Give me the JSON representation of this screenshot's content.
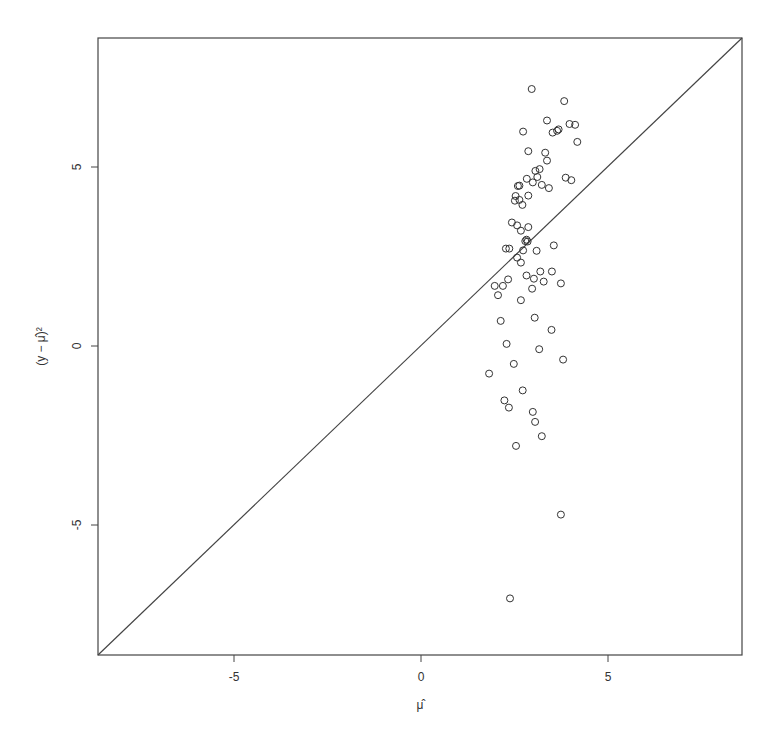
{
  "chart_data": {
    "type": "scatter",
    "title": "",
    "xlabel": "μ̂",
    "ylabel": "(y − μ̂)²",
    "xlim": [
      -8.64,
      8.58
    ],
    "ylim": [
      -8.6,
      8.6
    ],
    "x_ticks": [
      -5,
      0,
      5
    ],
    "y_ticks": [
      -5,
      0,
      5
    ],
    "x_tick_labels": [
      "-5",
      "0",
      "5"
    ],
    "y_tick_labels": [
      "-5",
      "0",
      "5"
    ],
    "grid": false,
    "legend": null,
    "reference_line": {
      "type": "identity",
      "label": "y = x",
      "color": "#444444"
    },
    "marker": {
      "shape": "open-circle",
      "radius": 3.5,
      "color": "#333333"
    },
    "series": [
      {
        "name": "observations",
        "points": [
          [
            2.96,
            7.18
          ],
          [
            3.83,
            6.84
          ],
          [
            3.37,
            6.3
          ],
          [
            3.97,
            6.2
          ],
          [
            4.12,
            6.18
          ],
          [
            2.73,
            5.99
          ],
          [
            3.52,
            5.96
          ],
          [
            3.64,
            6.01
          ],
          [
            3.68,
            6.05
          ],
          [
            4.18,
            5.7
          ],
          [
            2.87,
            5.44
          ],
          [
            3.32,
            5.4
          ],
          [
            3.37,
            5.18
          ],
          [
            3.06,
            4.89
          ],
          [
            3.17,
            4.94
          ],
          [
            2.83,
            4.67
          ],
          [
            2.99,
            4.57
          ],
          [
            3.11,
            4.72
          ],
          [
            3.23,
            4.5
          ],
          [
            3.42,
            4.41
          ],
          [
            3.87,
            4.7
          ],
          [
            4.02,
            4.63
          ],
          [
            2.59,
            4.47
          ],
          [
            2.63,
            4.48
          ],
          [
            2.53,
            4.19
          ],
          [
            2.87,
            4.2
          ],
          [
            2.51,
            4.06
          ],
          [
            2.63,
            4.08
          ],
          [
            2.71,
            3.94
          ],
          [
            2.43,
            3.45
          ],
          [
            2.57,
            3.37
          ],
          [
            2.67,
            3.22
          ],
          [
            2.87,
            3.32
          ],
          [
            2.79,
            2.93
          ],
          [
            2.82,
            2.97
          ],
          [
            2.85,
            2.92
          ],
          [
            2.27,
            2.72
          ],
          [
            2.36,
            2.72
          ],
          [
            2.73,
            2.67
          ],
          [
            3.09,
            2.66
          ],
          [
            3.55,
            2.81
          ],
          [
            2.57,
            2.47
          ],
          [
            2.67,
            2.33
          ],
          [
            2.82,
            1.97
          ],
          [
            3.19,
            2.08
          ],
          [
            3.5,
            2.08
          ],
          [
            2.33,
            1.86
          ],
          [
            3.02,
            1.88
          ],
          [
            3.28,
            1.8
          ],
          [
            3.74,
            1.75
          ],
          [
            1.97,
            1.68
          ],
          [
            2.19,
            1.68
          ],
          [
            2.97,
            1.6
          ],
          [
            2.06,
            1.42
          ],
          [
            2.67,
            1.28
          ],
          [
            2.13,
            0.7
          ],
          [
            3.04,
            0.79
          ],
          [
            3.49,
            0.45
          ],
          [
            2.29,
            0.06
          ],
          [
            3.16,
            -0.09
          ],
          [
            3.8,
            -0.38
          ],
          [
            2.48,
            -0.5
          ],
          [
            1.82,
            -0.77
          ],
          [
            2.72,
            -1.24
          ],
          [
            2.23,
            -1.52
          ],
          [
            2.35,
            -1.72
          ],
          [
            2.99,
            -1.84
          ],
          [
            3.05,
            -2.12
          ],
          [
            3.23,
            -2.52
          ],
          [
            2.54,
            -2.79
          ],
          [
            3.74,
            -4.71
          ],
          [
            2.38,
            -7.05
          ]
        ]
      }
    ]
  },
  "layout": {
    "plot_box": {
      "left": 98,
      "top": 38,
      "right": 742,
      "bottom": 655
    },
    "x_zero_px": 421,
    "x_px_per_unit": 37.4,
    "y_zero_px": 346,
    "y_px_per_unit": 35.8
  }
}
